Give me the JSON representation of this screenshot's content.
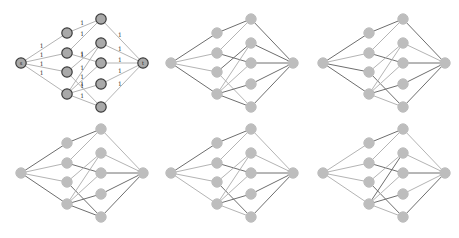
{
  "figure": {
    "colors": {
      "node_fill": "#bdbdbd",
      "node_outline": "#3c3c3c",
      "edge_default": "#b4b4b4",
      "edge_highlight": "#6e6e6e"
    }
  },
  "graph": {
    "nodes": [
      {
        "id": "s",
        "layer": 0,
        "label": "s"
      },
      {
        "id": "a1",
        "layer": 1
      },
      {
        "id": "a2",
        "layer": 1
      },
      {
        "id": "a3",
        "layer": 1
      },
      {
        "id": "a4",
        "layer": 1
      },
      {
        "id": "b1",
        "layer": 2
      },
      {
        "id": "b2",
        "layer": 2
      },
      {
        "id": "b3",
        "layer": 2
      },
      {
        "id": "b4",
        "layer": 2
      },
      {
        "id": "b5",
        "layer": 2
      },
      {
        "id": "t",
        "layer": 3,
        "label": "t"
      }
    ],
    "edges": [
      [
        "s",
        "a1"
      ],
      [
        "s",
        "a2"
      ],
      [
        "s",
        "a3"
      ],
      [
        "s",
        "a4"
      ],
      [
        "a1",
        "b1"
      ],
      [
        "a2",
        "b1"
      ],
      [
        "a2",
        "b3"
      ],
      [
        "a3",
        "b2"
      ],
      [
        "a3",
        "b5"
      ],
      [
        "a4",
        "b2"
      ],
      [
        "a4",
        "b3"
      ],
      [
        "a4",
        "b4"
      ],
      [
        "a4",
        "b5"
      ],
      [
        "b1",
        "t"
      ],
      [
        "b2",
        "t"
      ],
      [
        "b3",
        "t"
      ],
      [
        "b4",
        "t"
      ],
      [
        "b5",
        "t"
      ]
    ],
    "capacity_label": "1"
  },
  "panels": [
    {
      "id": "panel-1",
      "show_capacities": true,
      "outlined_nodes": true,
      "highlighted": []
    },
    {
      "id": "panel-2",
      "show_capacities": false,
      "outlined_nodes": false,
      "highlighted": [
        [
          "s",
          "a1"
        ],
        [
          "a1",
          "b1"
        ],
        [
          "b1",
          "t"
        ],
        [
          "s",
          "a4"
        ],
        [
          "a4",
          "b5"
        ],
        [
          "b5",
          "t"
        ],
        [
          "a2",
          "b3"
        ],
        [
          "b3",
          "t"
        ],
        [
          "a4",
          "b4"
        ],
        [
          "b4",
          "t"
        ],
        [
          "a3",
          "b2"
        ],
        [
          "b2",
          "t"
        ]
      ]
    },
    {
      "id": "panel-3",
      "show_capacities": false,
      "outlined_nodes": false,
      "highlighted": [
        [
          "s",
          "a1"
        ],
        [
          "a1",
          "b1"
        ],
        [
          "b1",
          "t"
        ],
        [
          "s",
          "a3"
        ],
        [
          "a3",
          "b5"
        ],
        [
          "b5",
          "t"
        ],
        [
          "a2",
          "b3"
        ],
        [
          "b3",
          "t"
        ],
        [
          "a4",
          "b4"
        ],
        [
          "b4",
          "t"
        ],
        [
          "s",
          "a4"
        ]
      ]
    },
    {
      "id": "panel-4",
      "show_capacities": false,
      "outlined_nodes": false,
      "highlighted": [
        [
          "s",
          "a1"
        ],
        [
          "a1",
          "b1"
        ],
        [
          "s",
          "a4"
        ],
        [
          "a4",
          "b5"
        ],
        [
          "a2",
          "b3"
        ],
        [
          "b3",
          "t"
        ],
        [
          "a3",
          "b5"
        ],
        [
          "b4",
          "t"
        ],
        [
          "b5",
          "t"
        ],
        [
          "a4",
          "b4"
        ]
      ]
    },
    {
      "id": "panel-5",
      "show_capacities": false,
      "outlined_nodes": false,
      "highlighted": [
        [
          "s",
          "a1"
        ],
        [
          "a1",
          "b1"
        ],
        [
          "a2",
          "b3"
        ],
        [
          "a4",
          "b4"
        ],
        [
          "a3",
          "b5"
        ],
        [
          "b4",
          "t"
        ],
        [
          "b5",
          "t"
        ],
        [
          "b3",
          "t"
        ]
      ]
    },
    {
      "id": "panel-6",
      "show_capacities": false,
      "outlined_nodes": false,
      "highlighted": [
        [
          "a1",
          "b1"
        ],
        [
          "a2",
          "b3"
        ],
        [
          "a4",
          "b4"
        ],
        [
          "a3",
          "b5"
        ],
        [
          "a4",
          "b2"
        ],
        [
          "b5",
          "t"
        ],
        [
          "b3",
          "t"
        ]
      ]
    }
  ]
}
